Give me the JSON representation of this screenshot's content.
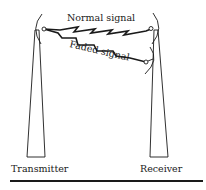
{
  "diagram": {
    "labels": {
      "normal_signal": "Normal signal",
      "faded_signal": "Faded signal",
      "transmitter": "Transmitter",
      "receiver": "Receiver"
    },
    "colors": {
      "line": "#1a1a1a",
      "background": "#ffffff"
    }
  }
}
